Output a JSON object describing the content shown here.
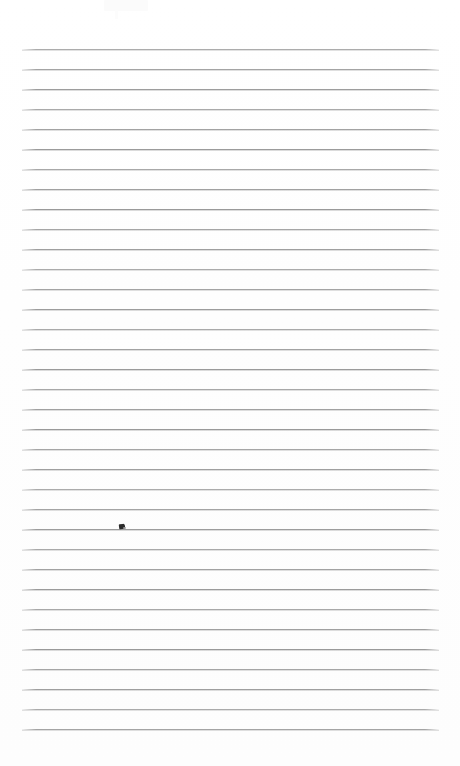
{
  "document": {
    "kind": "scanned-ruled-paper",
    "title": "Blank ruled notebook page",
    "page_width": 460,
    "page_height": 766,
    "background_color": "#fefefe",
    "has_text_content": false,
    "written_content": ""
  },
  "ruling": {
    "line_color": "#9a9a9a",
    "line_thickness_px": 1,
    "line_count": 35,
    "line_spacing_px": 20,
    "first_line_y": 49,
    "last_line_y": 729,
    "line_start_x": 22,
    "line_end_x": 439,
    "top_margin_px": 49,
    "bottom_margin_px": 37,
    "left_margin_px": 22,
    "right_margin_px": 21,
    "has_vertical_margin_rule": false,
    "has_holes": false,
    "line_y_positions": [
      49,
      69,
      89,
      109,
      129,
      149,
      169,
      189,
      209,
      229,
      249,
      269,
      289,
      309,
      329,
      349,
      369,
      389,
      409,
      429,
      449,
      469,
      489,
      509,
      529,
      549,
      569,
      589,
      609,
      629,
      649,
      669,
      689,
      709,
      729
    ]
  },
  "marks": {
    "ink_smudge": {
      "label": "small dark ink mark",
      "x": 119,
      "y": 524,
      "width": 6,
      "height": 5,
      "color": "#2b2b2b"
    },
    "scan_artifact": {
      "label": "faint light scan artifact top-left",
      "x": 104,
      "y": 0,
      "width": 44,
      "height": 11,
      "color": "#fbfbfb"
    }
  }
}
